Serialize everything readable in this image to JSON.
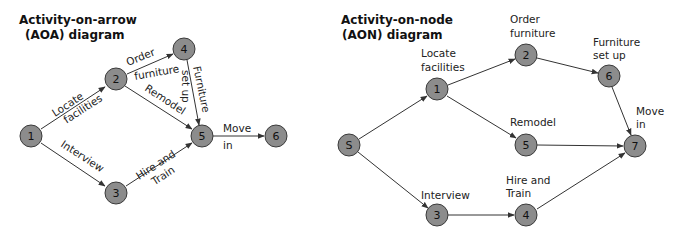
{
  "aoa": {
    "title_line1": "Activity-on-arrow",
    "title_line2": "(AOA) diagram",
    "nodes": [
      {
        "id": "1",
        "label": "1"
      },
      {
        "id": "2",
        "label": "2"
      },
      {
        "id": "3",
        "label": "3"
      },
      {
        "id": "4",
        "label": "4"
      },
      {
        "id": "5",
        "label": "5"
      },
      {
        "id": "6",
        "label": "6"
      }
    ],
    "edges": [
      {
        "from": "1",
        "to": "2",
        "label_line1": "Locate",
        "label_line2": "facilities"
      },
      {
        "from": "1",
        "to": "3",
        "label_line1": "Interview"
      },
      {
        "from": "2",
        "to": "4",
        "label_line1": "Order",
        "label_line2": "furniture"
      },
      {
        "from": "2",
        "to": "5",
        "label_line1": "Remodel"
      },
      {
        "from": "4",
        "to": "5",
        "label_line1": "Furniture",
        "label_line2": "set up"
      },
      {
        "from": "3",
        "to": "5",
        "label_line1": "Hire and",
        "label_line2": "Train"
      },
      {
        "from": "5",
        "to": "6",
        "label_line1": "Move",
        "label_line2": "in"
      }
    ]
  },
  "aon": {
    "title_line1": "Activity-on-node",
    "title_line2": "(AON) diagram",
    "nodes": [
      {
        "id": "S",
        "label": "S"
      },
      {
        "id": "1",
        "label": "1",
        "caption_line1": "Locate",
        "caption_line2": "facilities"
      },
      {
        "id": "2",
        "label": "2",
        "caption_line1": "Order",
        "caption_line2": "furniture"
      },
      {
        "id": "3",
        "label": "3",
        "caption_line1": "Interview"
      },
      {
        "id": "4",
        "label": "4",
        "caption_line1": "Hire and",
        "caption_line2": "Train"
      },
      {
        "id": "5",
        "label": "5",
        "caption_line1": "Remodel"
      },
      {
        "id": "6",
        "label": "6",
        "caption_line1": "Furniture",
        "caption_line2": "set up"
      },
      {
        "id": "7",
        "label": "7",
        "caption_line1": "Move",
        "caption_line2": "in"
      }
    ],
    "edges": [
      {
        "from": "S",
        "to": "1"
      },
      {
        "from": "S",
        "to": "3"
      },
      {
        "from": "1",
        "to": "2"
      },
      {
        "from": "1",
        "to": "5"
      },
      {
        "from": "2",
        "to": "6"
      },
      {
        "from": "6",
        "to": "7"
      },
      {
        "from": "5",
        "to": "7"
      },
      {
        "from": "3",
        "to": "4"
      },
      {
        "from": "4",
        "to": "7"
      }
    ]
  },
  "colors": {
    "node_fill": "#8c8c8c",
    "node_stroke": "#3a3a3a",
    "edge": "#333333"
  }
}
